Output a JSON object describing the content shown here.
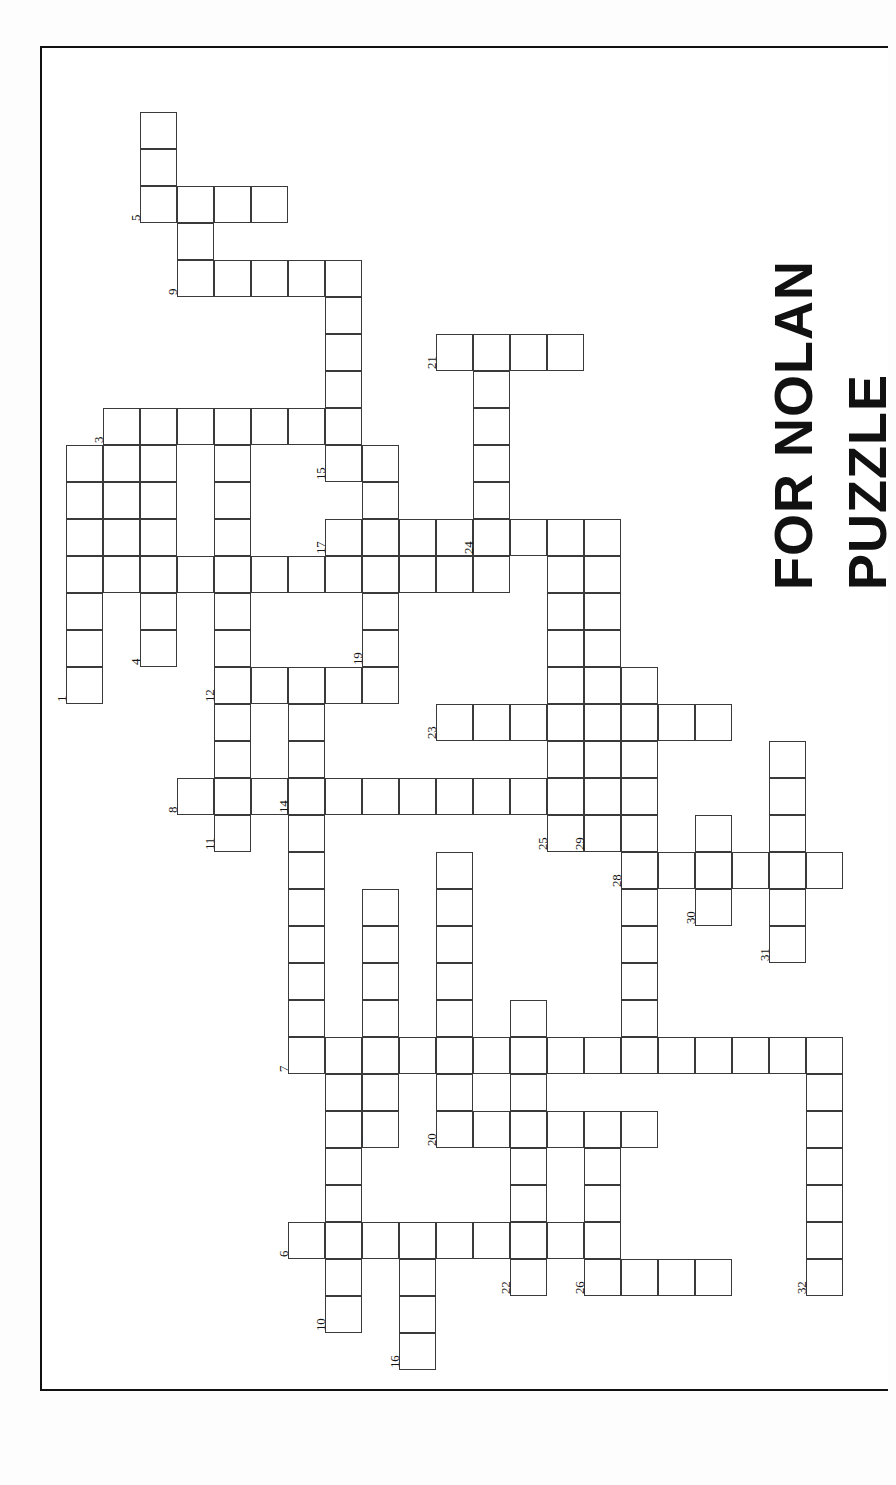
{
  "document": {
    "kind": "crossword-puzzle-worksheet",
    "orientation": "landscape-page-rotated-90",
    "title_line_1": "PUZZLE",
    "title_line_2": "FOR NOLAN",
    "grid": {
      "cell_size_px": 37,
      "origin_x_px": 66,
      "origin_y_px": 75,
      "total_clue_numbers": 32
    }
  },
  "clue_numbers": [
    1,
    2,
    3,
    4,
    5,
    6,
    7,
    8,
    9,
    10,
    11,
    12,
    13,
    14,
    15,
    16,
    17,
    18,
    19,
    20,
    21,
    22,
    23,
    24,
    25,
    26,
    27,
    28,
    29,
    30,
    31,
    32
  ],
  "entries": [
    {
      "number": 5,
      "dir": "down",
      "col": 2,
      "row": 1,
      "len": 3,
      "label_cell": 2
    },
    {
      "number": 5,
      "dir": "across",
      "col": 2,
      "row": 3,
      "len": 4,
      "label_cell": 0
    },
    {
      "number": 9,
      "dir": "down",
      "col": 3,
      "row": 3,
      "len": 3,
      "label_cell": 2
    },
    {
      "number": 9,
      "dir": "across",
      "col": 3,
      "row": 5,
      "len": 5,
      "label_cell": 0
    },
    {
      "number": 15,
      "dir": "down",
      "col": 7,
      "row": 5,
      "len": 6,
      "label_cell": 5
    },
    {
      "number": 3,
      "dir": "across",
      "col": 1,
      "row": 9,
      "len": 7,
      "label_cell": 0
    },
    {
      "number": 1,
      "dir": "down",
      "col": 0,
      "row": 10,
      "len": 7,
      "label_cell": 6
    },
    {
      "number": 2,
      "dir": "across",
      "col": 0,
      "row": 13,
      "len": 12,
      "label_cell": 0
    },
    {
      "number": 4,
      "dir": "down",
      "col": 2,
      "row": 10,
      "len": 6,
      "label_cell": 5
    },
    {
      "number": 12,
      "dir": "down",
      "col": 4,
      "row": 10,
      "len": 11,
      "label_cell": 6
    },
    {
      "number": 12,
      "dir": "across",
      "col": 4,
      "row": 16,
      "len": 5,
      "label_cell": 0
    },
    {
      "number": 17,
      "dir": "across",
      "col": 7,
      "row": 12,
      "len": 11,
      "label_cell": 0
    },
    {
      "number": 19,
      "dir": "down",
      "col": 8,
      "row": 10,
      "len": 6,
      "label_cell": 5
    },
    {
      "number": 21,
      "dir": "across",
      "col": 10,
      "row": 7,
      "len": 4,
      "label_cell": 0
    },
    {
      "number": 21,
      "dir": "down",
      "col": 11,
      "row": 7,
      "len": 6,
      "label_cell": 0
    },
    {
      "number": 24,
      "dir": "across",
      "col": 11,
      "row": 12,
      "len": 4,
      "label_cell": 0
    },
    {
      "number": 23,
      "dir": "across",
      "col": 10,
      "row": 17,
      "len": 8,
      "label_cell": 0
    },
    {
      "number": 8,
      "dir": "across",
      "col": 3,
      "row": 19,
      "len": 10,
      "label_cell": 0
    },
    {
      "number": 11,
      "dir": "down",
      "col": 4,
      "row": 16,
      "len": 5,
      "label_cell": 4
    },
    {
      "number": 14,
      "dir": "down",
      "col": 6,
      "row": 16,
      "len": 10,
      "label_cell": 3
    },
    {
      "number": 25,
      "dir": "down",
      "col": 13,
      "row": 14,
      "len": 7,
      "label_cell": 6
    },
    {
      "number": 29,
      "dir": "down",
      "col": 14,
      "row": 12,
      "len": 8,
      "label_cell": 7
    },
    {
      "number": 28,
      "dir": "down",
      "col": 15,
      "row": 16,
      "len": 11,
      "label_cell": 5
    },
    {
      "number": 28,
      "dir": "across",
      "col": 15,
      "row": 21,
      "len": 6,
      "label_cell": 0
    },
    {
      "number": 30,
      "dir": "down",
      "col": 17,
      "row": 20,
      "len": 3,
      "label_cell": 2
    },
    {
      "number": 31,
      "dir": "down",
      "col": 19,
      "row": 18,
      "len": 6,
      "label_cell": 5
    },
    {
      "number": 27,
      "dir": "across",
      "col": 15,
      "row": 26,
      "len": 7,
      "label_cell": 0
    },
    {
      "number": 32,
      "dir": "down",
      "col": 20,
      "row": 26,
      "len": 7,
      "label_cell": 6
    },
    {
      "number": 7,
      "dir": "across",
      "col": 6,
      "row": 26,
      "len": 9,
      "label_cell": 0
    },
    {
      "number": 13,
      "dir": "down",
      "col": 8,
      "row": 22,
      "len": 7,
      "label_cell": 6
    },
    {
      "number": 18,
      "dir": "down",
      "col": 10,
      "row": 21,
      "len": 8,
      "label_cell": 7
    },
    {
      "number": 20,
      "dir": "across",
      "col": 10,
      "row": 28,
      "len": 6,
      "label_cell": 0
    },
    {
      "number": 6,
      "dir": "across",
      "col": 6,
      "row": 31,
      "len": 9,
      "label_cell": 0
    },
    {
      "number": 10,
      "dir": "down",
      "col": 7,
      "row": 26,
      "len": 8,
      "label_cell": 7
    },
    {
      "number": 16,
      "dir": "down",
      "col": 9,
      "row": 31,
      "len": 4,
      "label_cell": 3
    },
    {
      "number": 22,
      "dir": "down",
      "col": 12,
      "row": 28,
      "len": 5,
      "label_cell": 4
    },
    {
      "number": 26,
      "dir": "across",
      "col": 14,
      "row": 32,
      "len": 5,
      "label_cell": 0
    },
    {
      "number": 26,
      "dir": "down",
      "col": 14,
      "row": 29,
      "len": 4,
      "label_cell": 3
    }
  ],
  "cells": [
    {
      "c": 2,
      "r": 1
    },
    {
      "c": 2,
      "r": 2
    },
    {
      "c": 2,
      "r": 3,
      "n": 5
    },
    {
      "c": 3,
      "r": 3
    },
    {
      "c": 4,
      "r": 3
    },
    {
      "c": 5,
      "r": 3
    },
    {
      "c": 3,
      "r": 4
    },
    {
      "c": 3,
      "r": 5,
      "n": 9
    },
    {
      "c": 4,
      "r": 5
    },
    {
      "c": 5,
      "r": 5
    },
    {
      "c": 6,
      "r": 5
    },
    {
      "c": 7,
      "r": 5
    },
    {
      "c": 7,
      "r": 6
    },
    {
      "c": 7,
      "r": 7
    },
    {
      "c": 7,
      "r": 8
    },
    {
      "c": 1,
      "r": 9,
      "n": 3
    },
    {
      "c": 2,
      "r": 9
    },
    {
      "c": 3,
      "r": 9
    },
    {
      "c": 4,
      "r": 9
    },
    {
      "c": 5,
      "r": 9
    },
    {
      "c": 6,
      "r": 9
    },
    {
      "c": 7,
      "r": 9
    },
    {
      "c": 7,
      "r": 10,
      "n": 15
    },
    {
      "c": 0,
      "r": 10
    },
    {
      "c": 0,
      "r": 11
    },
    {
      "c": 0,
      "r": 12
    },
    {
      "c": 0,
      "r": 13
    },
    {
      "c": 0,
      "r": 14
    },
    {
      "c": 0,
      "r": 15
    },
    {
      "c": 0,
      "r": 16,
      "n": 1
    },
    {
      "c": 1,
      "r": 10
    },
    {
      "c": 1,
      "r": 11
    },
    {
      "c": 1,
      "r": 12
    },
    {
      "c": 1,
      "r": 13
    },
    {
      "c": 2,
      "r": 10
    },
    {
      "c": 2,
      "r": 11
    },
    {
      "c": 2,
      "r": 12
    },
    {
      "c": 2,
      "r": 13
    },
    {
      "c": 2,
      "r": 14
    },
    {
      "c": 2,
      "r": 15,
      "n": 4
    },
    {
      "c": 3,
      "r": 13
    },
    {
      "c": 4,
      "r": 13
    },
    {
      "c": 5,
      "r": 13
    },
    {
      "c": 6,
      "r": 13
    },
    {
      "c": 7,
      "r": 13
    },
    {
      "c": 8,
      "r": 13
    },
    {
      "c": 9,
      "r": 13
    },
    {
      "c": 10,
      "r": 13
    },
    {
      "c": 11,
      "r": 13
    },
    {
      "c": 4,
      "r": 10
    },
    {
      "c": 4,
      "r": 11
    },
    {
      "c": 4,
      "r": 12
    },
    {
      "c": 4,
      "r": 14
    },
    {
      "c": 4,
      "r": 15
    },
    {
      "c": 4,
      "r": 16,
      "n": 12
    },
    {
      "c": 5,
      "r": 16
    },
    {
      "c": 6,
      "r": 16
    },
    {
      "c": 7,
      "r": 16
    },
    {
      "c": 8,
      "r": 16
    },
    {
      "c": 8,
      "r": 10
    },
    {
      "c": 8,
      "r": 11
    },
    {
      "c": 8,
      "r": 12
    },
    {
      "c": 8,
      "r": 14
    },
    {
      "c": 8,
      "r": 15,
      "n": 19
    },
    {
      "c": 7,
      "r": 12,
      "n": 17
    },
    {
      "c": 9,
      "r": 12
    },
    {
      "c": 10,
      "r": 12
    },
    {
      "c": 11,
      "r": 12,
      "n": 24
    },
    {
      "c": 12,
      "r": 12
    },
    {
      "c": 13,
      "r": 12
    },
    {
      "c": 14,
      "r": 12
    },
    {
      "c": 10,
      "r": 7,
      "n": 21
    },
    {
      "c": 11,
      "r": 7
    },
    {
      "c": 12,
      "r": 7
    },
    {
      "c": 13,
      "r": 7
    },
    {
      "c": 11,
      "r": 8
    },
    {
      "c": 11,
      "r": 9
    },
    {
      "c": 11,
      "r": 10
    },
    {
      "c": 11,
      "r": 11
    },
    {
      "c": 13,
      "r": 13
    },
    {
      "c": 13,
      "r": 14
    },
    {
      "c": 13,
      "r": 15
    },
    {
      "c": 13,
      "r": 16
    },
    {
      "c": 13,
      "r": 17
    },
    {
      "c": 13,
      "r": 18
    },
    {
      "c": 13,
      "r": 19
    },
    {
      "c": 13,
      "r": 20,
      "n": 25
    },
    {
      "c": 14,
      "r": 13
    },
    {
      "c": 14,
      "r": 14
    },
    {
      "c": 14,
      "r": 15
    },
    {
      "c": 14,
      "r": 16
    },
    {
      "c": 14,
      "r": 17
    },
    {
      "c": 14,
      "r": 18
    },
    {
      "c": 14,
      "r": 19
    },
    {
      "c": 14,
      "r": 20,
      "n": 29
    },
    {
      "c": 10,
      "r": 17,
      "n": 23
    },
    {
      "c": 11,
      "r": 17
    },
    {
      "c": 12,
      "r": 17
    },
    {
      "c": 15,
      "r": 17
    },
    {
      "c": 16,
      "r": 17
    },
    {
      "c": 17,
      "r": 17
    },
    {
      "c": 4,
      "r": 17
    },
    {
      "c": 4,
      "r": 18
    },
    {
      "c": 4,
      "r": 19
    },
    {
      "c": 4,
      "r": 20,
      "n": 11
    },
    {
      "c": 3,
      "r": 19,
      "n": 8
    },
    {
      "c": 5,
      "r": 19
    },
    {
      "c": 6,
      "r": 19,
      "n": 14
    },
    {
      "c": 7,
      "r": 19
    },
    {
      "c": 8,
      "r": 19
    },
    {
      "c": 9,
      "r": 19
    },
    {
      "c": 10,
      "r": 19
    },
    {
      "c": 11,
      "r": 19
    },
    {
      "c": 12,
      "r": 19
    },
    {
      "c": 6,
      "r": 17
    },
    {
      "c": 6,
      "r": 18
    },
    {
      "c": 6,
      "r": 20
    },
    {
      "c": 6,
      "r": 21
    },
    {
      "c": 6,
      "r": 22
    },
    {
      "c": 6,
      "r": 23
    },
    {
      "c": 6,
      "r": 24
    },
    {
      "c": 6,
      "r": 25
    },
    {
      "c": 8,
      "r": 22
    },
    {
      "c": 8,
      "r": 23
    },
    {
      "c": 8,
      "r": 24
    },
    {
      "c": 8,
      "r": 25
    },
    {
      "c": 8,
      "r": 26
    },
    {
      "c": 8,
      "r": 27
    },
    {
      "c": 8,
      "r": 28,
      "n": 13
    },
    {
      "c": 15,
      "r": 16
    },
    {
      "c": 15,
      "r": 17
    },
    {
      "c": 15,
      "r": 18
    },
    {
      "c": 15,
      "r": 19
    },
    {
      "c": 15,
      "r": 20
    },
    {
      "c": 15,
      "r": 21,
      "n": 28
    },
    {
      "c": 15,
      "r": 22
    },
    {
      "c": 15,
      "r": 23
    },
    {
      "c": 15,
      "r": 24
    },
    {
      "c": 15,
      "r": 25
    },
    {
      "c": 15,
      "r": 26,
      "n": 27
    },
    {
      "c": 16,
      "r": 21
    },
    {
      "c": 17,
      "r": 21
    },
    {
      "c": 18,
      "r": 21
    },
    {
      "c": 19,
      "r": 21
    },
    {
      "c": 20,
      "r": 21
    },
    {
      "c": 17,
      "r": 20
    },
    {
      "c": 17,
      "r": 22,
      "n": 30
    },
    {
      "c": 19,
      "r": 18
    },
    {
      "c": 19,
      "r": 19
    },
    {
      "c": 19,
      "r": 20
    },
    {
      "c": 19,
      "r": 22
    },
    {
      "c": 19,
      "r": 23,
      "n": 31
    },
    {
      "c": 16,
      "r": 26
    },
    {
      "c": 17,
      "r": 26
    },
    {
      "c": 18,
      "r": 26
    },
    {
      "c": 19,
      "r": 26
    },
    {
      "c": 20,
      "r": 26
    },
    {
      "c": 20,
      "r": 27
    },
    {
      "c": 20,
      "r": 28
    },
    {
      "c": 20,
      "r": 29
    },
    {
      "c": 20,
      "r": 30
    },
    {
      "c": 20,
      "r": 31
    },
    {
      "c": 20,
      "r": 32,
      "n": 32
    },
    {
      "c": 6,
      "r": 26,
      "n": 7
    },
    {
      "c": 7,
      "r": 26
    },
    {
      "c": 9,
      "r": 26
    },
    {
      "c": 10,
      "r": 26
    },
    {
      "c": 11,
      "r": 26
    },
    {
      "c": 12,
      "r": 26
    },
    {
      "c": 13,
      "r": 26
    },
    {
      "c": 14,
      "r": 26
    },
    {
      "c": 10,
      "r": 21
    },
    {
      "c": 10,
      "r": 22
    },
    {
      "c": 10,
      "r": 23
    },
    {
      "c": 10,
      "r": 24
    },
    {
      "c": 10,
      "r": 25
    },
    {
      "c": 10,
      "r": 27
    },
    {
      "c": 10,
      "r": 28,
      "n": 20
    },
    {
      "c": 11,
      "r": 28
    },
    {
      "c": 12,
      "r": 28
    },
    {
      "c": 13,
      "r": 28
    },
    {
      "c": 14,
      "r": 28
    },
    {
      "c": 15,
      "r": 28
    },
    {
      "c": 12,
      "r": 25
    },
    {
      "c": 12,
      "r": 27
    },
    {
      "c": 12,
      "r": 29
    },
    {
      "c": 12,
      "r": 30
    },
    {
      "c": 12,
      "r": 31
    },
    {
      "c": 12,
      "r": 32,
      "n": 22
    },
    {
      "c": 6,
      "r": 31,
      "n": 6
    },
    {
      "c": 7,
      "r": 31
    },
    {
      "c": 8,
      "r": 31
    },
    {
      "c": 9,
      "r": 31
    },
    {
      "c": 10,
      "r": 31
    },
    {
      "c": 11,
      "r": 31
    },
    {
      "c": 13,
      "r": 31
    },
    {
      "c": 7,
      "r": 27
    },
    {
      "c": 7,
      "r": 28
    },
    {
      "c": 7,
      "r": 29
    },
    {
      "c": 7,
      "r": 30
    },
    {
      "c": 7,
      "r": 32
    },
    {
      "c": 7,
      "r": 33,
      "n": 10
    },
    {
      "c": 9,
      "r": 32
    },
    {
      "c": 9,
      "r": 33
    },
    {
      "c": 9,
      "r": 34,
      "n": 16
    },
    {
      "c": 14,
      "r": 29
    },
    {
      "c": 14,
      "r": 30
    },
    {
      "c": 14,
      "r": 31
    },
    {
      "c": 14,
      "r": 32,
      "n": 26
    },
    {
      "c": 15,
      "r": 32
    },
    {
      "c": 16,
      "r": 32
    },
    {
      "c": 17,
      "r": 32
    }
  ]
}
